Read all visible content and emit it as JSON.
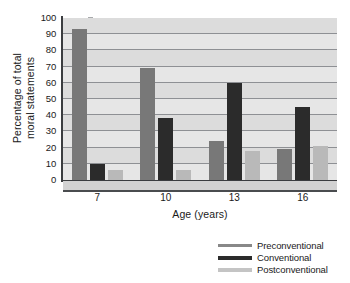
{
  "chart_data": {
    "type": "bar",
    "title": "",
    "xlabel": "Age (years)",
    "ylabel_lines": [
      "Percentage of total",
      "moral statements"
    ],
    "categories": [
      "7",
      "10",
      "13",
      "16"
    ],
    "series": [
      {
        "name": "Preconventional",
        "color": "#787878",
        "values": [
          93,
          69,
          24,
          19
        ]
      },
      {
        "name": "Conventional",
        "color": "#2b2b2b",
        "values": [
          10,
          38,
          60,
          45
        ]
      },
      {
        "name": "Postconventional",
        "color": "#b9b9b9",
        "values": [
          6,
          6,
          18,
          21
        ]
      }
    ],
    "ylim": [
      0,
      100
    ],
    "yticks": [
      0,
      10,
      20,
      30,
      40,
      50,
      60,
      70,
      80,
      90,
      100
    ],
    "ytick_labels": [
      "0",
      "10",
      "20",
      "30",
      "40",
      "50",
      "60",
      "70",
      "80",
      "90",
      "100"
    ],
    "grid": true,
    "legend_position": "bottom-right",
    "plot_background": "#dcdcdc",
    "grid_color": "#8e9094",
    "axis_color": "#3b3d40"
  }
}
